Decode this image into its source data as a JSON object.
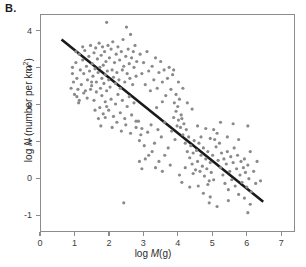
{
  "panel": {
    "label": "B."
  },
  "chart_data": {
    "type": "scatter",
    "title": "",
    "panel_label": "B.",
    "xlabel": "log M(g)",
    "xlabel_parts": {
      "prefix": "log ",
      "italic": "M",
      "suffix": "(g)"
    },
    "ylabel": "log N (number per km2)",
    "ylabel_parts": {
      "prefix": "log ",
      "italic": "N",
      "suffix": " (number per km",
      "superscript": "2",
      "tail": ")"
    },
    "xlim": [
      0,
      7.4
    ],
    "ylim": [
      -1.45,
      4.45
    ],
    "xticks": [
      0,
      1,
      2,
      3,
      4,
      5,
      6,
      7
    ],
    "xtick_labels": [
      "0",
      "1",
      "2",
      "3",
      "4",
      "5",
      "6",
      "7"
    ],
    "yticks": [
      -1,
      0,
      1,
      2,
      3,
      4
    ],
    "ytick_labels": [
      "-1",
      "0",
      "1",
      "2",
      "3",
      "4"
    ],
    "grid": false,
    "legend": null,
    "marker_color": "#8a8a8a",
    "marker_size": 1.6,
    "fit_line": {
      "label": "regression line",
      "color": "#1a1a1a",
      "width": 2.6,
      "x_start": 0.6,
      "y_start": 3.78,
      "x_end": 6.5,
      "y_end": -0.65,
      "slope": -0.75,
      "intercept": 4.23
    },
    "points": [
      [
        0.92,
        3.02
      ],
      [
        0.95,
        2.62
      ],
      [
        0.98,
        2.28
      ],
      [
        1.02,
        3.15
      ],
      [
        1.05,
        2.72
      ],
      [
        1.08,
        2.42
      ],
      [
        1.12,
        3.38
      ],
      [
        1.15,
        2.95
      ],
      [
        1.18,
        2.55
      ],
      [
        1.22,
        3.22
      ],
      [
        1.25,
        2.85
      ],
      [
        1.28,
        3.48
      ],
      [
        1.3,
        2.38
      ],
      [
        1.33,
        3.05
      ],
      [
        1.36,
        2.68
      ],
      [
        1.4,
        3.32
      ],
      [
        1.42,
        2.92
      ],
      [
        1.45,
        3.62
      ],
      [
        1.48,
        2.52
      ],
      [
        1.5,
        3.12
      ],
      [
        1.52,
        2.78
      ],
      [
        1.55,
        3.42
      ],
      [
        1.58,
        2.98
      ],
      [
        1.6,
        3.55
      ],
      [
        1.62,
        2.62
      ],
      [
        1.65,
        3.25
      ],
      [
        1.67,
        2.88
      ],
      [
        1.7,
        3.68
      ],
      [
        1.72,
        3.02
      ],
      [
        1.74,
        2.45
      ],
      [
        1.76,
        3.35
      ],
      [
        1.78,
        2.72
      ],
      [
        1.8,
        3.58
      ],
      [
        1.82,
        3.08
      ],
      [
        1.84,
        2.58
      ],
      [
        1.86,
        3.45
      ],
      [
        1.88,
        2.82
      ],
      [
        1.9,
        3.18
      ],
      [
        1.92,
        4.25
      ],
      [
        1.94,
        2.92
      ],
      [
        1.96,
        3.62
      ],
      [
        1.98,
        2.68
      ],
      [
        2.0,
        3.28
      ],
      [
        2.02,
        2.48
      ],
      [
        2.05,
        3.52
      ],
      [
        2.08,
        2.95
      ],
      [
        2.1,
        3.72
      ],
      [
        2.12,
        2.75
      ],
      [
        2.15,
        3.15
      ],
      [
        2.18,
        2.58
      ],
      [
        2.2,
        3.38
      ],
      [
        2.22,
        2.88
      ],
      [
        2.25,
        3.58
      ],
      [
        2.28,
        2.68
      ],
      [
        2.3,
        3.22
      ],
      [
        2.32,
        2.45
      ],
      [
        2.35,
        3.45
      ],
      [
        2.38,
        2.95
      ],
      [
        2.4,
        3.78
      ],
      [
        2.42,
        3.05
      ],
      [
        2.45,
        2.62
      ],
      [
        2.48,
        3.32
      ],
      [
        2.5,
        4.12
      ],
      [
        2.52,
        2.85
      ],
      [
        2.55,
        3.52
      ],
      [
        2.58,
        3.12
      ],
      [
        2.6,
        2.72
      ],
      [
        2.62,
        3.92
      ],
      [
        2.65,
        3.28
      ],
      [
        2.68,
        2.55
      ],
      [
        2.7,
        3.45
      ],
      [
        2.72,
        3.02
      ],
      [
        2.75,
        3.62
      ],
      [
        2.78,
        2.78
      ],
      [
        2.8,
        3.18
      ],
      [
        1.05,
        2.22
      ],
      [
        1.1,
        2.05
      ],
      [
        1.25,
        2.32
      ],
      [
        1.35,
        2.18
      ],
      [
        1.45,
        2.42
      ],
      [
        1.55,
        2.12
      ],
      [
        1.62,
        2.35
      ],
      [
        1.72,
        1.92
      ],
      [
        1.78,
        2.25
      ],
      [
        1.82,
        1.75
      ],
      [
        1.88,
        2.08
      ],
      [
        1.92,
        2.38
      ],
      [
        1.98,
        1.85
      ],
      [
        2.05,
        2.15
      ],
      [
        2.12,
        1.68
      ],
      [
        2.18,
        2.02
      ],
      [
        2.25,
        2.28
      ],
      [
        2.32,
        1.78
      ],
      [
        2.38,
        2.12
      ],
      [
        2.45,
        1.62
      ],
      [
        2.52,
        1.95
      ],
      [
        2.58,
        2.22
      ],
      [
        2.65,
        1.72
      ],
      [
        2.72,
        2.05
      ],
      [
        2.78,
        1.55
      ],
      [
        1.75,
        1.42
      ],
      [
        1.88,
        1.65
      ],
      [
        2.08,
        1.38
      ],
      [
        2.22,
        1.52
      ],
      [
        2.35,
        1.28
      ],
      [
        2.48,
        1.45
      ],
      [
        2.62,
        1.22
      ],
      [
        2.78,
        1.38
      ],
      [
        2.85,
        1.55
      ],
      [
        2.92,
        1.18
      ],
      [
        2.9,
        3.38
      ],
      [
        2.95,
        2.85
      ],
      [
        3.0,
        3.15
      ],
      [
        3.05,
        2.55
      ],
      [
        3.1,
        3.45
      ],
      [
        3.15,
        2.92
      ],
      [
        3.2,
        2.38
      ],
      [
        3.25,
        3.05
      ],
      [
        3.3,
        2.68
      ],
      [
        3.35,
        3.28
      ],
      [
        3.4,
        2.45
      ],
      [
        3.45,
        2.88
      ],
      [
        3.5,
        3.18
      ],
      [
        3.55,
        2.62
      ],
      [
        3.6,
        2.95
      ],
      [
        3.65,
        2.25
      ],
      [
        3.7,
        2.72
      ],
      [
        3.75,
        3.02
      ],
      [
        3.8,
        2.42
      ],
      [
        3.85,
        2.82
      ],
      [
        2.88,
        1.02
      ],
      [
        2.95,
        1.35
      ],
      [
        3.02,
        0.88
      ],
      [
        3.12,
        1.25
      ],
      [
        3.22,
        1.45
      ],
      [
        3.32,
        0.95
      ],
      [
        3.42,
        1.32
      ],
      [
        3.52,
        1.12
      ],
      [
        3.62,
        1.52
      ],
      [
        3.72,
        0.82
      ],
      [
        3.82,
        1.28
      ],
      [
        3.88,
        1.65
      ],
      [
        3.92,
        1.05
      ],
      [
        3.95,
        1.82
      ],
      [
        3.98,
        1.42
      ],
      [
        3.05,
        0.52
      ],
      [
        3.25,
        0.72
      ],
      [
        3.45,
        0.45
      ],
      [
        3.62,
        0.62
      ],
      [
        3.78,
        0.35
      ],
      [
        3.9,
        2.05
      ],
      [
        3.95,
        2.28
      ],
      [
        4.0,
        1.95
      ],
      [
        4.05,
        2.15
      ],
      [
        4.1,
        1.72
      ],
      [
        4.02,
        1.58
      ],
      [
        4.08,
        1.38
      ],
      [
        4.12,
        1.62
      ],
      [
        4.15,
        1.18
      ],
      [
        4.18,
        1.48
      ],
      [
        4.22,
        0.95
      ],
      [
        4.25,
        1.32
      ],
      [
        4.28,
        0.72
      ],
      [
        4.32,
        1.12
      ],
      [
        4.35,
        0.55
      ],
      [
        4.38,
        0.88
      ],
      [
        4.42,
        0.38
      ],
      [
        4.45,
        0.68
      ],
      [
        4.48,
        1.02
      ],
      [
        4.52,
        0.22
      ],
      [
        4.05,
        0.08
      ],
      [
        4.12,
        -0.12
      ],
      [
        4.22,
        0.28
      ],
      [
        4.35,
        -0.25
      ],
      [
        4.45,
        0.12
      ],
      [
        4.55,
        0.75
      ],
      [
        4.58,
        0.45
      ],
      [
        4.62,
        0.95
      ],
      [
        4.65,
        0.18
      ],
      [
        4.68,
        0.62
      ],
      [
        4.72,
        0.32
      ],
      [
        4.75,
        0.82
      ],
      [
        4.78,
        0.05
      ],
      [
        4.82,
        0.52
      ],
      [
        4.85,
        0.25
      ],
      [
        4.88,
        0.72
      ],
      [
        4.92,
        -0.08
      ],
      [
        4.95,
        0.42
      ],
      [
        4.98,
        0.15
      ],
      [
        5.02,
        0.62
      ],
      [
        4.6,
        -0.22
      ],
      [
        4.75,
        -0.42
      ],
      [
        4.88,
        -0.18
      ],
      [
        4.95,
        -0.52
      ],
      [
        5.05,
        -0.05
      ],
      [
        5.08,
        1.05
      ],
      [
        5.12,
        0.85
      ],
      [
        5.15,
        1.22
      ],
      [
        5.18,
        0.48
      ],
      [
        5.22,
        0.95
      ],
      [
        5.25,
        0.28
      ],
      [
        5.28,
        0.68
      ],
      [
        5.32,
        0.08
      ],
      [
        5.35,
        0.52
      ],
      [
        5.38,
        -0.15
      ],
      [
        5.42,
        0.38
      ],
      [
        5.45,
        0.72
      ],
      [
        5.48,
        -0.32
      ],
      [
        5.52,
        0.18
      ],
      [
        5.55,
        0.58
      ],
      [
        5.58,
        -0.05
      ],
      [
        5.62,
        0.42
      ],
      [
        5.65,
        0.82
      ],
      [
        5.68,
        -0.22
      ],
      [
        5.72,
        0.25
      ],
      [
        5.75,
        0.62
      ],
      [
        5.78,
        -0.45
      ],
      [
        5.82,
        0.08
      ],
      [
        5.85,
        0.45
      ],
      [
        5.88,
        -0.12
      ],
      [
        5.92,
        0.28
      ],
      [
        5.95,
        -0.55
      ],
      [
        5.98,
        0.15
      ],
      [
        6.02,
        -0.25
      ],
      [
        6.05,
        0.35
      ],
      [
        6.08,
        -0.02
      ],
      [
        6.12,
        0.72
      ],
      [
        6.15,
        -0.38
      ],
      [
        6.22,
        0.18
      ],
      [
        6.28,
        -0.15
      ],
      [
        6.05,
        -0.95
      ],
      [
        6.12,
        -0.72
      ],
      [
        5.48,
        -0.62
      ],
      [
        5.15,
        -0.78
      ],
      [
        4.92,
        -0.68
      ],
      [
        5.62,
        1.48
      ],
      [
        5.78,
        1.05
      ],
      [
        5.95,
        0.52
      ],
      [
        6.32,
        0.45
      ],
      [
        6.42,
        -0.08
      ],
      [
        6.05,
        1.42
      ],
      [
        5.25,
        1.52
      ],
      [
        4.58,
        1.42
      ],
      [
        4.42,
        1.88
      ],
      [
        4.28,
        2.05
      ],
      [
        4.15,
        2.45
      ],
      [
        4.02,
        2.62
      ],
      [
        3.88,
        2.95
      ],
      [
        3.55,
        2.08
      ],
      [
        3.38,
        1.92
      ],
      [
        2.42,
        -0.68
      ],
      [
        1.92,
        1.95
      ],
      [
        1.68,
        1.62
      ],
      [
        1.58,
        1.85
      ],
      [
        1.48,
        2.62
      ],
      [
        0.88,
        2.45
      ],
      [
        0.92,
        2.85
      ],
      [
        1.02,
        3.45
      ],
      [
        1.12,
        2.12
      ],
      [
        1.22,
        3.58
      ],
      [
        2.88,
        0.45
      ],
      [
        3.15,
        0.62
      ],
      [
        2.95,
        0.25
      ],
      [
        3.35,
        0.28
      ],
      [
        3.55,
        0.18
      ],
      [
        4.68,
        1.12
      ],
      [
        4.82,
        1.35
      ],
      [
        4.95,
        1.08
      ],
      [
        5.05,
        1.32
      ],
      [
        5.45,
        1.12
      ]
    ]
  }
}
